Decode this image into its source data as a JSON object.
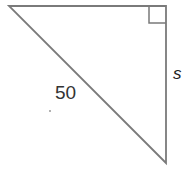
{
  "diagram": {
    "type": "right-triangle",
    "vertices": {
      "top_left": [
        9,
        6
      ],
      "top_right_right_angle": [
        166,
        6
      ],
      "bottom_right": [
        166,
        163
      ]
    },
    "right_angle_marker_size": 17,
    "stroke_color": "#7a7a7a",
    "labels": {
      "hypotenuse": "50",
      "vertical_side": "s"
    }
  }
}
